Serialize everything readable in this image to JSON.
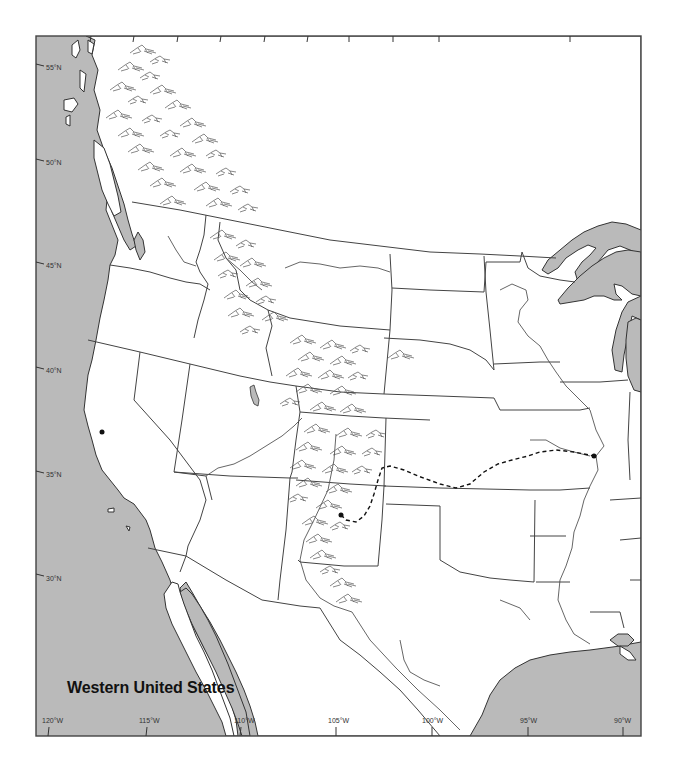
{
  "map": {
    "title": "Western United States",
    "colors": {
      "water": "#bababa",
      "land": "#ffffff",
      "border": "#444444",
      "trail": "#111111"
    },
    "latitude_labels": [
      {
        "label": "55°N",
        "y": 68
      },
      {
        "label": "50°N",
        "y": 163
      },
      {
        "label": "45°N",
        "y": 266
      },
      {
        "label": "40°N",
        "y": 371
      },
      {
        "label": "35°N",
        "y": 475
      },
      {
        "label": "30°N",
        "y": 579
      }
    ],
    "longitude_labels": [
      {
        "label": "120°W",
        "x": 48
      },
      {
        "label": "115°W",
        "x": 146
      },
      {
        "label": "110°W",
        "x": 240
      },
      {
        "label": "105°W",
        "x": 335
      },
      {
        "label": "100°W",
        "x": 431
      },
      {
        "label": "95°W",
        "x": 528
      },
      {
        "label": "90°W",
        "x": 623
      }
    ],
    "features": {
      "trail": "dashed route line",
      "trail_endpoints": [
        "eastern dot on Mississippi River",
        "western dot in northern New Mexico"
      ],
      "relief": "mountain range hachures along Rocky Mountains and Coast Ranges"
    }
  }
}
